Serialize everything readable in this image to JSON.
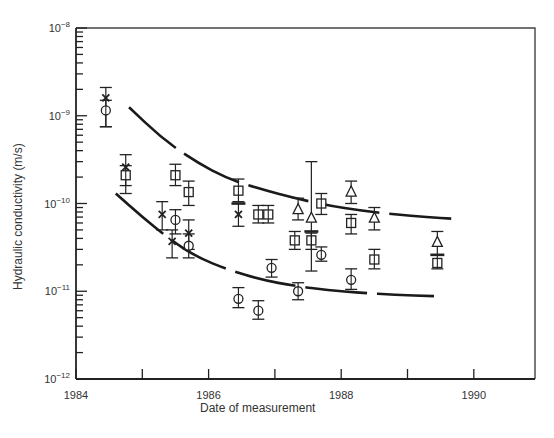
{
  "chart_data": {
    "type": "scatter",
    "title": "",
    "xlabel": "Date of measurement",
    "ylabel": "Hydraulic conductivity (m/s)",
    "yscale": "log",
    "xlim": [
      1984,
      1991
    ],
    "ylim": [
      1e-12,
      1e-08
    ],
    "x_ticks": [
      1984,
      1985,
      1986,
      1987,
      1988,
      1989,
      1990
    ],
    "x_tick_labels": [
      "1984",
      "1986",
      "1988",
      "1990"
    ],
    "x_tick_label_values": [
      1984,
      1986,
      1988,
      1990
    ],
    "y_tick_labels": [
      "10",
      "10",
      "10",
      "10",
      "10"
    ],
    "y_tick_exponents": [
      "-8",
      "-9",
      "-10",
      "-11",
      "-12"
    ],
    "y_tick_values": [
      1e-08,
      1e-09,
      1e-10,
      1e-11,
      1e-12
    ],
    "grid": false,
    "legend": null,
    "series": [
      {
        "name": "cross",
        "marker": "x",
        "points": [
          {
            "x": 1984.45,
            "y": 1.6e-09,
            "lo": 7.5e-10,
            "hi": 2.1e-09
          },
          {
            "x": 1984.75,
            "y": 2.6e-10,
            "lo": 1.3e-10,
            "hi": 3.6e-10
          },
          {
            "x": 1985.3,
            "y": 7.5e-11,
            "lo": 5e-11,
            "hi": 1.05e-10
          },
          {
            "x": 1985.45,
            "y": 3.7e-11,
            "lo": 2.4e-11,
            "hi": 5e-11
          },
          {
            "x": 1985.7,
            "y": 4.6e-11,
            "lo": 3e-11,
            "hi": 6.5e-11
          },
          {
            "x": 1986.45,
            "y": 7.5e-11,
            "lo": 5.5e-11,
            "hi": 1e-10
          }
        ]
      },
      {
        "name": "square",
        "marker": "s",
        "points": [
          {
            "x": 1984.75,
            "y": 2.1e-10,
            "lo": 1.6e-10,
            "hi": 2.7e-10
          },
          {
            "x": 1985.5,
            "y": 2.1e-10,
            "lo": 1.6e-10,
            "hi": 2.8e-10
          },
          {
            "x": 1985.7,
            "y": 1.35e-10,
            "lo": 9.5e-11,
            "hi": 1.8e-10
          },
          {
            "x": 1986.45,
            "y": 1.4e-10,
            "lo": 1.05e-10,
            "hi": 1.9e-10
          },
          {
            "x": 1986.75,
            "y": 7.5e-11,
            "lo": 6e-11,
            "hi": 9.5e-11
          },
          {
            "x": 1986.9,
            "y": 7.5e-11,
            "lo": 6e-11,
            "hi": 9.5e-11
          },
          {
            "x": 1987.3,
            "y": 3.8e-11,
            "lo": 3e-11,
            "hi": 4.8e-11
          },
          {
            "x": 1987.55,
            "y": 3.8e-11,
            "lo": 3e-11,
            "hi": 4.6e-11
          },
          {
            "x": 1987.7,
            "y": 1e-10,
            "lo": 7.5e-11,
            "hi": 1.3e-10
          },
          {
            "x": 1988.15,
            "y": 6e-11,
            "lo": 4.5e-11,
            "hi": 7.5e-11
          },
          {
            "x": 1988.5,
            "y": 2.3e-11,
            "lo": 1.8e-11,
            "hi": 3e-11
          },
          {
            "x": 1989.45,
            "y": 2.1e-11,
            "lo": 1.8e-11,
            "hi": 2.6e-11
          }
        ]
      },
      {
        "name": "circle",
        "marker": "o",
        "points": [
          {
            "x": 1984.45,
            "y": 1.15e-09,
            "lo": 7.5e-10,
            "hi": 1.5e-09
          },
          {
            "x": 1985.5,
            "y": 6.5e-11,
            "lo": 4.5e-11,
            "hi": 8.5e-11
          },
          {
            "x": 1985.7,
            "y": 3.3e-11,
            "lo": 2.4e-11,
            "hi": 4.5e-11
          },
          {
            "x": 1986.45,
            "y": 8.2e-12,
            "lo": 6.5e-12,
            "hi": 1.1e-11
          },
          {
            "x": 1986.75,
            "y": 6e-12,
            "lo": 4.8e-12,
            "hi": 7.8e-12
          },
          {
            "x": 1186.95,
            "y": 1.85e-11,
            "lo": 1.45e-11,
            "hi": 2.3e-11
          },
          {
            "x": 1987.35,
            "y": 1e-11,
            "lo": 8e-12,
            "hi": 1.25e-11
          },
          {
            "x": 1987.7,
            "y": 2.6e-11,
            "lo": 2.2e-11,
            "hi": 3.2e-11
          },
          {
            "x": 1988.15,
            "y": 1.35e-11,
            "lo": 1.05e-11,
            "hi": 1.8e-11
          }
        ]
      },
      {
        "name": "triangle",
        "marker": "^",
        "points": [
          {
            "x": 1987.35,
            "y": 8.5e-11,
            "lo": 6.5e-11,
            "hi": 1.15e-10
          },
          {
            "x": 1987.55,
            "y": 6.8e-11,
            "lo": 1.7e-11,
            "hi": 3e-10
          },
          {
            "x": 1988.15,
            "y": 1.35e-10,
            "lo": 1e-10,
            "hi": 1.8e-10
          },
          {
            "x": 1988.5,
            "y": 6.8e-11,
            "lo": 5e-11,
            "hi": 9e-11
          },
          {
            "x": 1989.45,
            "y": 3.6e-11,
            "lo": 2.6e-11,
            "hi": 4.8e-11
          }
        ]
      },
      {
        "name": "mean-bar",
        "marker": "_",
        "points": [
          {
            "x": 1986.45,
            "y": 1e-10
          },
          {
            "x": 1987.55,
            "y": 4.8e-11
          },
          {
            "x": 1989.45,
            "y": 2.6e-11
          }
        ]
      }
    ],
    "envelope_curves": [
      {
        "name": "upper-bound",
        "style": "dashed",
        "points": [
          [
            1984.8,
            1.25e-09
          ],
          [
            1985.3,
            5.5e-10
          ],
          [
            1985.8,
            3e-10
          ],
          [
            1986.3,
            1.9e-10
          ],
          [
            1986.8,
            1.45e-10
          ],
          [
            1987.3,
            1.15e-10
          ],
          [
            1987.8,
            9.5e-11
          ],
          [
            1988.3,
            8.3e-11
          ],
          [
            1988.8,
            7.5e-11
          ],
          [
            1989.3,
            7e-11
          ],
          [
            1989.7,
            6.7e-11
          ]
        ]
      },
      {
        "name": "lower-bound",
        "style": "dashed",
        "points": [
          [
            1984.6,
            1.3e-10
          ],
          [
            1985.0,
            7e-11
          ],
          [
            1985.4,
            4e-11
          ],
          [
            1985.8,
            2.5e-11
          ],
          [
            1986.3,
            1.75e-11
          ],
          [
            1986.8,
            1.35e-11
          ],
          [
            1987.3,
            1.15e-11
          ],
          [
            1987.8,
            1.03e-11
          ],
          [
            1988.3,
            9.6e-12
          ],
          [
            1988.8,
            9.1e-12
          ],
          [
            1989.4,
            8.8e-12
          ]
        ]
      }
    ]
  }
}
